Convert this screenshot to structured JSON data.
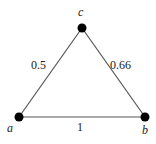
{
  "diagram": {
    "type": "weighted-graph",
    "nodes": [
      {
        "id": "a",
        "label": "a",
        "x": 19,
        "y": 117,
        "label_x": 10,
        "label_y": 132
      },
      {
        "id": "b",
        "label": "b",
        "x": 145,
        "y": 117,
        "label_x": 145,
        "label_y": 134
      },
      {
        "id": "c",
        "label": "c",
        "x": 82,
        "y": 28,
        "label_x": 79,
        "label_y": 16
      }
    ],
    "edges": [
      {
        "from": "a",
        "to": "c",
        "weight": "0.5",
        "label_x": 32,
        "label_y": 69
      },
      {
        "from": "c",
        "to": "b",
        "weight": "0.66",
        "label_x": 110,
        "label_y": 69
      },
      {
        "from": "a",
        "to": "b",
        "weight": "1",
        "label_x": 77,
        "label_y": 131
      }
    ],
    "colors": {
      "edge": "#555555",
      "node": "#000000",
      "text": "#222222"
    }
  }
}
